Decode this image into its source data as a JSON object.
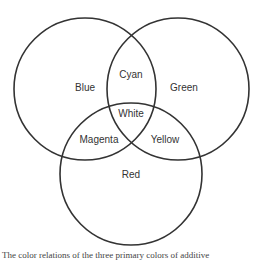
{
  "diagram": {
    "type": "venn",
    "circles": [
      {
        "name": "Blue",
        "cx": 85,
        "cy": 89,
        "r": 71
      },
      {
        "name": "Green",
        "cx": 178,
        "cy": 89,
        "r": 71
      },
      {
        "name": "Red",
        "cx": 131,
        "cy": 174,
        "r": 71
      }
    ],
    "labels": {
      "blue": "Blue",
      "green": "Green",
      "red": "Red",
      "cyan": "Cyan",
      "white": "White",
      "magenta": "Magenta",
      "yellow": "Yellow"
    },
    "stroke_color": "#333333"
  },
  "caption": "The color relations of the three primary colors of additive"
}
